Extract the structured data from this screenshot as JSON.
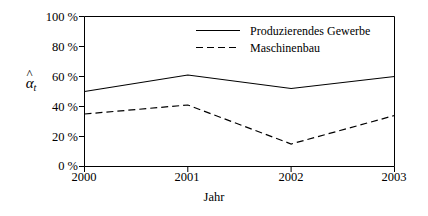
{
  "chart_data": {
    "type": "line",
    "title": "",
    "xlabel": "Jahr",
    "ylabel": "α̂_t",
    "x": [
      "2000",
      "2001",
      "2002",
      "2003"
    ],
    "categories": [
      "2000",
      "2001",
      "2002",
      "2003"
    ],
    "series": [
      {
        "name": "Produzierendes Gewerbe",
        "style": "solid",
        "color": "#000000",
        "values": [
          50,
          61,
          52,
          60
        ]
      },
      {
        "name": "Maschinenbau",
        "style": "dashed",
        "color": "#000000",
        "values": [
          35,
          41,
          15,
          34
        ]
      }
    ],
    "ylim": [
      0,
      100
    ],
    "yticks": [
      0,
      20,
      40,
      60,
      80,
      100
    ],
    "ytick_labels": [
      "0 %",
      "20 %",
      "40 %",
      "60 %",
      "80 %",
      "100 %"
    ],
    "xtick_labels": [
      "2000",
      "2001",
      "2002",
      "2003"
    ],
    "grid": false,
    "legend_position": "top-center"
  },
  "axes": {
    "y_axis_label_base": "α",
    "y_axis_label_subscript": "t",
    "x_axis_label": "Jahr"
  },
  "legend": {
    "entries": [
      {
        "label": "Produzierendes Gewerbe",
        "style": "solid"
      },
      {
        "label": "Maschinenbau",
        "style": "dashed"
      }
    ]
  }
}
